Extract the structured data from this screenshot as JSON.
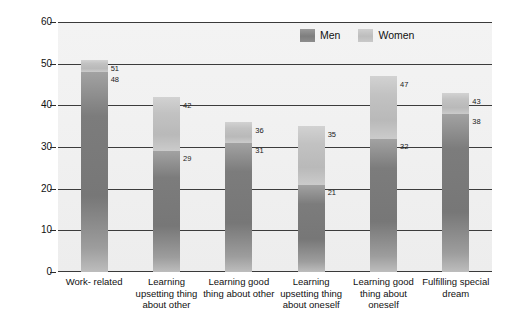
{
  "chart_data": {
    "type": "bar",
    "subtype": "stacked-grouped-pair",
    "title": "",
    "xlabel": "",
    "ylabel": "Percentage reporting",
    "ylim": [
      0,
      60
    ],
    "ytick_values": [
      0,
      10,
      20,
      30,
      40,
      50,
      60
    ],
    "ytick_labels": [
      "0",
      "10",
      "20",
      "30",
      "40",
      "50",
      "60"
    ],
    "grid": true,
    "legend_position": "top-right",
    "categories": [
      "Work- related",
      "Learning upsetting thing about other",
      "Learning good thing about other",
      "Learning upsetting thing about oneself",
      "Learning good thing about oneself",
      "Fulfilling special dream"
    ],
    "series": [
      {
        "name": "Men",
        "color": "#7c7c7c",
        "values": [
          48,
          29,
          31,
          21,
          32,
          38
        ]
      },
      {
        "name": "Women",
        "color": "#c2c2c2",
        "values": [
          51,
          42,
          36,
          35,
          47,
          43
        ]
      }
    ],
    "annotations": {
      "note": "Each bar shows the Women total as the full bar height with the Men value drawn as the darker lower portion; data labels printed to the right of each bar."
    }
  },
  "legend": {
    "items": [
      {
        "label": "Men",
        "swatch": "men"
      },
      {
        "label": "Women",
        "swatch": "women"
      }
    ]
  },
  "axes": {
    "y_title": "Percentage reporting"
  },
  "colors": {
    "men": "#7c7c7c",
    "women": "#c2c2c2",
    "plot_background": "#f1f1f1",
    "gridline": "#3c3c3c",
    "text": "#111111"
  }
}
